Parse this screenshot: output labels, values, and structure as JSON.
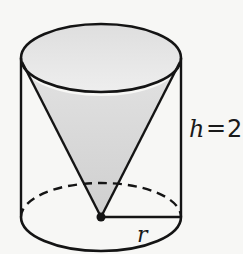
{
  "diagram": {
    "shapes": {
      "cylinder": {
        "name": "cylinder"
      },
      "cone": {
        "name": "inverted-cone",
        "fill": "#d4d4d4"
      }
    },
    "labels": {
      "height_var": "h",
      "height_eq": "=",
      "height_value": "2",
      "radius_var": "r"
    },
    "colors": {
      "stroke": "#141414",
      "cone_fill": "#d6d6d6",
      "background": "#f7f7f5"
    }
  }
}
